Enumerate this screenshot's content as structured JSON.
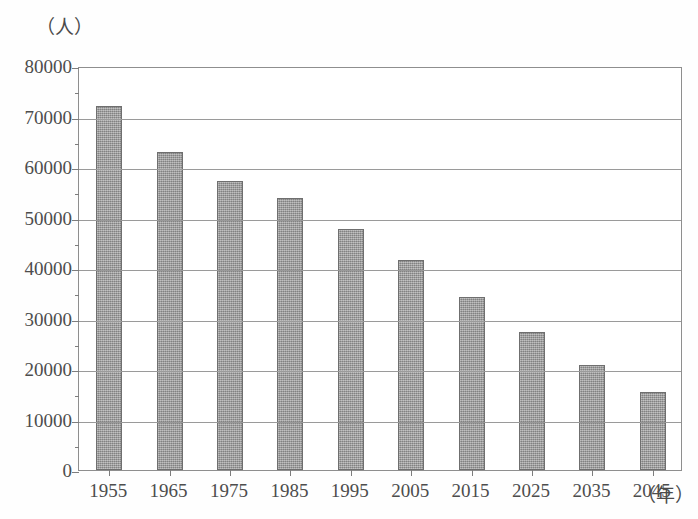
{
  "chart_data": {
    "type": "bar",
    "title": "",
    "subtitle": "",
    "xlabel": "(年)",
    "ylabel": "(人)",
    "y_unit_label": "（人）",
    "x_unit_label": "（年）",
    "categories": [
      "1955",
      "1965",
      "1975",
      "1985",
      "1995",
      "2005",
      "2015",
      "2025",
      "2035",
      "2045"
    ],
    "values": [
      72000,
      62900,
      57200,
      53800,
      47700,
      41600,
      34200,
      27300,
      20700,
      15500
    ],
    "ylim": [
      0,
      80000
    ],
    "ytick_labels": [
      "0",
      "10000",
      "20000",
      "30000",
      "40000",
      "50000",
      "60000",
      "70000",
      "80000"
    ],
    "ytick_values": [
      0,
      10000,
      20000,
      30000,
      40000,
      50000,
      60000,
      70000,
      80000
    ],
    "grid": true,
    "grid_axis": "y",
    "legend": false,
    "legend_position": "none",
    "bar_color": "#9d9d9d",
    "bar_edge_color": "#6f6f6f",
    "axis_color": "#8e8e8e",
    "grid_color": "#9a9a9a",
    "background_color": "#ffffff",
    "text_color": "#4d4d4d"
  }
}
